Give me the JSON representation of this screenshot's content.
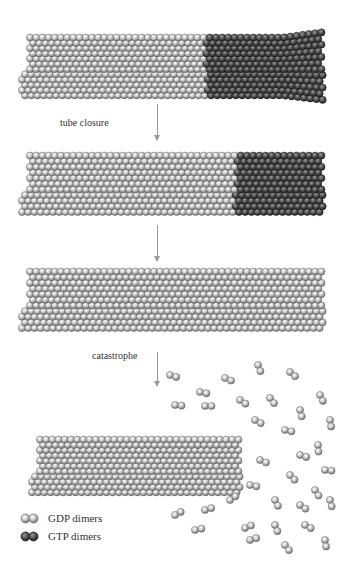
{
  "figure": {
    "stages": [
      {
        "id": "growing",
        "gtp_cap": "large"
      },
      {
        "id": "cap-shrinking",
        "gtp_cap": "small"
      },
      {
        "id": "no-cap",
        "gtp_cap": "none"
      },
      {
        "id": "depolymerizing",
        "gtp_cap": "none"
      }
    ],
    "transitions": [
      {
        "label": "tube closure"
      },
      {
        "label": ""
      },
      {
        "label": "catastrophe"
      }
    ]
  },
  "legend": {
    "items": [
      {
        "label": "GDP dimers",
        "color": "#bdbdbd"
      },
      {
        "label": "GTP dimers",
        "color": "#4a4a4a"
      }
    ]
  },
  "colors": {
    "gdp": "#c4c4c4",
    "gdp_edge": "#6e6e6e",
    "gtp": "#4d4d4d",
    "gtp_edge": "#222222",
    "arrow": "#999999"
  }
}
